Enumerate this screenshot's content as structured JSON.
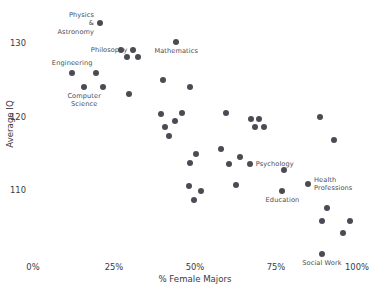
{
  "chart_data": {
    "type": "scatter",
    "title": "",
    "xlabel": "% Female Majors",
    "ylabel": "Average IQ",
    "xlim": [
      0,
      1.0
    ],
    "ylim": [
      104.8,
      133.6
    ],
    "grid": false,
    "legend": null,
    "xticks": [
      "0%",
      "25%",
      "50%",
      "75%",
      "100%"
    ],
    "xtick_values": [
      0,
      25,
      50,
      75,
      100
    ],
    "yticks": [
      "130",
      "120",
      "110"
    ],
    "ytick_values": [
      130,
      120,
      110
    ],
    "marker_color": "#4b4b54",
    "background": "#ffffff",
    "points": [
      {
        "label": "Physics\n&\nAstronomy",
        "label_pos": "left",
        "x": 20.7,
        "y": 132.7
      },
      {
        "label": "",
        "label_pos": "",
        "x": 27.2,
        "y": 129.0
      },
      {
        "label": "Philosophy",
        "label_pos": "left",
        "x": 31.0,
        "y": 129.0
      },
      {
        "label": "",
        "label_pos": "",
        "x": 29.0,
        "y": 128.1
      },
      {
        "label": "",
        "label_pos": "",
        "x": 32.4,
        "y": 128.1
      },
      {
        "label": "Mathematics",
        "label_pos": "below",
        "x": 44.2,
        "y": 130.1
      },
      {
        "label": "Engineering",
        "label_pos": "above",
        "x": 12.1,
        "y": 125.9
      },
      {
        "label": "",
        "label_pos": "",
        "x": 19.5,
        "y": 125.9
      },
      {
        "label": "Computer\nScience",
        "label_pos": "below",
        "x": 15.8,
        "y": 124.0
      },
      {
        "label": "",
        "label_pos": "",
        "x": 21.6,
        "y": 124.0
      },
      {
        "label": "",
        "label_pos": "",
        "x": 29.6,
        "y": 123.1
      },
      {
        "label": "",
        "label_pos": "",
        "x": 40.1,
        "y": 125.0
      },
      {
        "label": "",
        "label_pos": "",
        "x": 48.4,
        "y": 124.0
      },
      {
        "label": "",
        "label_pos": "",
        "x": 39.5,
        "y": 120.4
      },
      {
        "label": "",
        "label_pos": "",
        "x": 46.0,
        "y": 120.5
      },
      {
        "label": "",
        "label_pos": "",
        "x": 43.8,
        "y": 119.4
      },
      {
        "label": "",
        "label_pos": "",
        "x": 40.7,
        "y": 118.6
      },
      {
        "label": "",
        "label_pos": "",
        "x": 41.9,
        "y": 117.4
      },
      {
        "label": "",
        "label_pos": "",
        "x": 59.5,
        "y": 120.5
      },
      {
        "label": "",
        "label_pos": "",
        "x": 67.3,
        "y": 119.6
      },
      {
        "label": "",
        "label_pos": "",
        "x": 69.7,
        "y": 119.6
      },
      {
        "label": "",
        "label_pos": "",
        "x": 68.5,
        "y": 118.6
      },
      {
        "label": "",
        "label_pos": "",
        "x": 71.3,
        "y": 118.6
      },
      {
        "label": "",
        "label_pos": "",
        "x": 88.6,
        "y": 119.9
      },
      {
        "label": "",
        "label_pos": "",
        "x": 93.0,
        "y": 116.8
      },
      {
        "label": "",
        "label_pos": "",
        "x": 50.3,
        "y": 114.9
      },
      {
        "label": "",
        "label_pos": "",
        "x": 48.5,
        "y": 113.7
      },
      {
        "label": "",
        "label_pos": "",
        "x": 58.1,
        "y": 115.6
      },
      {
        "label": "",
        "label_pos": "",
        "x": 64.0,
        "y": 114.5
      },
      {
        "label": "",
        "label_pos": "",
        "x": 60.5,
        "y": 113.6
      },
      {
        "label": "Psychology",
        "label_pos": "right",
        "x": 66.9,
        "y": 113.6
      },
      {
        "label": "",
        "label_pos": "",
        "x": 77.6,
        "y": 112.7
      },
      {
        "label": "",
        "label_pos": "",
        "x": 48.2,
        "y": 110.6
      },
      {
        "label": "",
        "label_pos": "",
        "x": 51.9,
        "y": 109.8
      },
      {
        "label": "",
        "label_pos": "",
        "x": 49.7,
        "y": 108.7
      },
      {
        "label": "",
        "label_pos": "",
        "x": 62.7,
        "y": 110.7
      },
      {
        "label": "Health\nProfessions",
        "label_pos": "right",
        "x": 84.9,
        "y": 110.8
      },
      {
        "label": "Education",
        "label_pos": "below",
        "x": 77.0,
        "y": 109.9
      },
      {
        "label": "",
        "label_pos": "",
        "x": 90.8,
        "y": 107.5
      },
      {
        "label": "",
        "label_pos": "",
        "x": 89.2,
        "y": 105.8
      },
      {
        "label": "",
        "label_pos": "",
        "x": 97.8,
        "y": 105.8
      },
      {
        "label": "",
        "label_pos": "",
        "x": 95.6,
        "y": 104.1
      },
      {
        "label": "Social Work",
        "label_pos": "below",
        "x": 89.2,
        "y": 101.3
      }
    ]
  },
  "axis_geometry": {
    "x_pixel_0": 33.0,
    "x_pixel_100": 357.0,
    "y_pixel_130": 43.0,
    "y_pixel_110": 190.0
  }
}
